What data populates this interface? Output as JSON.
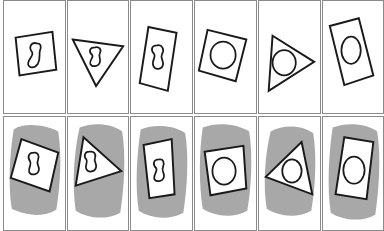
{
  "figure": {
    "colors": {
      "stroke": "#1a1a1a",
      "border": "#8a8a8a",
      "scribble": "#a8a8a8",
      "fill": "#ffffff"
    },
    "rows": [
      {
        "name": "plain",
        "background": "white",
        "panels": [
          {
            "outer": "square",
            "inner": "figure-eight"
          },
          {
            "outer": "triangle",
            "inner": "figure-eight"
          },
          {
            "outer": "rectangle",
            "inner": "figure-eight"
          },
          {
            "outer": "square",
            "inner": "circle"
          },
          {
            "outer": "triangle",
            "inner": "circle"
          },
          {
            "outer": "rectangle",
            "inner": "circle"
          }
        ]
      },
      {
        "name": "scribbled",
        "background": "gray-scribble",
        "panels": [
          {
            "outer": "square",
            "inner": "figure-eight"
          },
          {
            "outer": "triangle",
            "inner": "figure-eight"
          },
          {
            "outer": "rectangle",
            "inner": "figure-eight"
          },
          {
            "outer": "square",
            "inner": "circle"
          },
          {
            "outer": "triangle",
            "inner": "circle"
          },
          {
            "outer": "rectangle",
            "inner": "circle"
          }
        ]
      }
    ]
  }
}
